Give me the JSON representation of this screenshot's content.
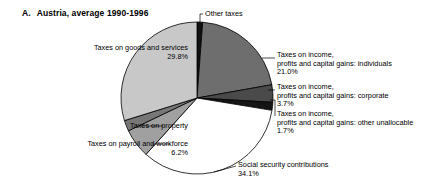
{
  "title": {
    "lead": "A.",
    "text": "Austria, average 1990-1996"
  },
  "labels": {
    "other_taxes": "Other taxes",
    "goods_services_l1": "Taxes on goods and services",
    "goods_services_l2": "29.8%",
    "individuals_l1": "Taxes on income,",
    "individuals_l2": "profits and capital gains: individuals",
    "individuals_l3": "21.0%",
    "corporate_l1": "Taxes on income,",
    "corporate_l2": "profits and capital gains: corporate",
    "corporate_l3": "3.7%",
    "unallocable_l1": "Taxes on income,",
    "unallocable_l2": "profits and capital gains: other unallocable",
    "unallocable_l3": "1.7%",
    "social_l1": "Social security contributions",
    "social_l2": "34.1%",
    "property_l1": "Taxes on property",
    "payroll_l1": "Taxes on payroll and workforce",
    "payroll_l2": "6.2%"
  },
  "chart_data": {
    "type": "pie",
    "subtitle": "",
    "xlabel": "",
    "ylabel": "",
    "legend_position": "none",
    "grid": false,
    "start_angle_deg": 0,
    "direction": "clockwise",
    "center": {
      "x": 197,
      "y": 98
    },
    "radius": 76,
    "categories": [
      "Other taxes",
      "Taxes on income, profits and capital gains: individuals",
      "Taxes on income, profits and capital gains: corporate",
      "Taxes on income, profits and capital gains: other unallocable",
      "Social security contributions",
      "Taxes on payroll and workforce",
      "Taxes on property",
      "Taxes on goods and services"
    ],
    "values": [
      1.2,
      21.0,
      3.7,
      1.7,
      34.1,
      6.2,
      2.3,
      29.8
    ],
    "value_labels": [
      "",
      "21.0%",
      "3.7%",
      "1.7%",
      "34.1%",
      "6.2%",
      "",
      "29.8%"
    ],
    "colors": [
      "#111111",
      "#6e6e6e",
      "#4a4a4a",
      "#151515",
      "#ffffff",
      "#a0a0a0",
      "#777777",
      "#c8c8c8"
    ],
    "units": "percent"
  },
  "palette": {
    "outline": "#000000",
    "background": "#ffffff",
    "text": "#000000"
  }
}
